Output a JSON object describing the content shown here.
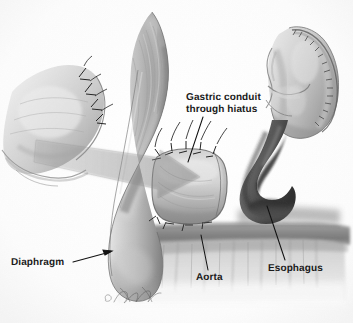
{
  "figure": {
    "type": "medical-illustration",
    "style": "grayscale pencil / airbrush anatomical rendering",
    "background_color": "#fbfbfb"
  },
  "labels": {
    "gastric_conduit": "Gastric conduit\nthrough hiatus",
    "gastric_conduit_line1": "Gastric conduit",
    "gastric_conduit_line2": "through hiatus",
    "diaphragm": "Diaphragm",
    "aorta": "Aorta",
    "esophagus": "Esophagus"
  },
  "signature": {
    "mark": "©",
    "artist": "Tim Phelps"
  },
  "colors": {
    "background": "#fbfbfb",
    "label_text": "#1a1a1a",
    "leader_line": "#121212",
    "tissue_light": "#d2d2d2",
    "tissue_mid": "#a8a8a8",
    "tissue_dark": "#6e6e6e",
    "tissue_shadow": "#4a4a4a",
    "esophagus_dark": "#3a3a3a",
    "aorta_band": "#8a8a8a",
    "suture": "#2a2a2a",
    "arrow_overlay": "#8e8e8e"
  },
  "anatomy": [
    {
      "name": "diaphragm-left-leaf",
      "description": "left hemidiaphragm leaf with interrupted sutures along its free edge"
    },
    {
      "name": "diaphragm-crus",
      "description": "large curved diaphragmatic crus sweeping from top center to lower left"
    },
    {
      "name": "gastric-conduit",
      "description": "tubular gastric conduit passing through the hiatus, sutured at the hiatal margin"
    },
    {
      "name": "gastric-fundus",
      "description": "gastric conduit body at right with longitudinal staple line"
    },
    {
      "name": "esophagus-stump",
      "description": "dark hook-shaped esophageal remnant"
    },
    {
      "name": "aorta",
      "description": "horizontal aortic band crossing beneath the hiatus"
    },
    {
      "name": "crural-muscle",
      "description": "vertical muscular striations of the crura below the aorta"
    },
    {
      "name": "direction-arrow",
      "description": "translucent arrow indicating the conduit being pulled through the hiatus"
    }
  ]
}
